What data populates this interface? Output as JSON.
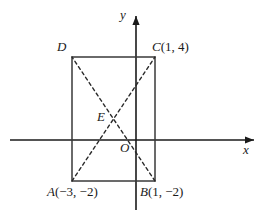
{
  "figure": {
    "type": "coordinate-geometry-diagram",
    "background_color": "#ffffff",
    "stroke_color": "#1a1a1a",
    "axes": {
      "x_label": "x",
      "y_label": "y",
      "origin_label": "O",
      "x_axis_y_pixel": 140,
      "y_axis_x_pixel": 136
    },
    "points": [
      {
        "name": "A",
        "label": "A",
        "coords": "(−3, −2)",
        "x": -3,
        "y": -2
      },
      {
        "name": "B",
        "label": "B",
        "coords": "(1, −2)",
        "x": 1,
        "y": -2
      },
      {
        "name": "C",
        "label": "C",
        "coords": "(1, 4)",
        "x": 1,
        "y": 4
      },
      {
        "name": "D",
        "label": "D",
        "coords": "",
        "x": -3,
        "y": 4
      },
      {
        "name": "E",
        "label": "E",
        "coords": "",
        "x": -1,
        "y": 1
      }
    ],
    "rectangle": {
      "vertices": [
        "A",
        "B",
        "C",
        "D"
      ],
      "left_px": 72,
      "right_px": 155,
      "top_px": 57,
      "bottom_px": 181,
      "line_style": "solid"
    },
    "diagonals": [
      {
        "from": "A",
        "to": "C",
        "line_style": "dashed"
      },
      {
        "from": "B",
        "to": "D",
        "line_style": "dashed"
      }
    ],
    "intersection": {
      "point": "E",
      "x_px": 113.5,
      "y_px": 119
    }
  }
}
